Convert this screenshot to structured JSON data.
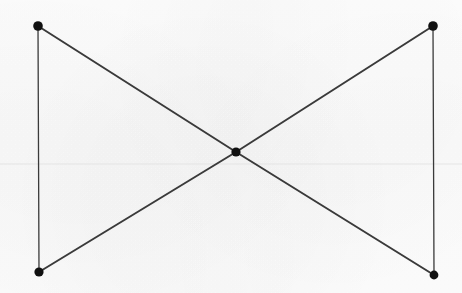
{
  "diagram": {
    "kind": "node-link-graph",
    "canvas": {
      "width": 462,
      "height": 293
    },
    "background_color": "#fcfcfc",
    "node_color": "#101010",
    "edge_color": "#3a3a3a",
    "edge_width": 1.9,
    "node_radius": 4.6,
    "nodes": [
      {
        "id": "top-left",
        "label": "",
        "x": 38,
        "y": 26,
        "radius": 4.8
      },
      {
        "id": "top-right",
        "label": "",
        "x": 433,
        "y": 26,
        "radius": 4.8
      },
      {
        "id": "center",
        "label": "",
        "x": 236,
        "y": 152,
        "radius": 4.6
      },
      {
        "id": "bottom-left",
        "label": "",
        "x": 39,
        "y": 272,
        "radius": 4.6
      },
      {
        "id": "bottom-right",
        "label": "",
        "x": 434,
        "y": 275,
        "radius": 4.4
      }
    ],
    "edges": [
      {
        "id": "edge-tl-center",
        "from": "top-left",
        "to": "center",
        "width": 2.0
      },
      {
        "id": "edge-center-br",
        "from": "center",
        "to": "bottom-right",
        "width": 2.0
      },
      {
        "id": "edge-tr-center",
        "from": "top-right",
        "to": "center",
        "width": 2.0
      },
      {
        "id": "edge-center-bl",
        "from": "center",
        "to": "bottom-left",
        "width": 2.0
      },
      {
        "id": "edge-tl-bl",
        "from": "top-left",
        "to": "bottom-left",
        "width": 1.3
      },
      {
        "id": "edge-tr-br",
        "from": "top-right",
        "to": "bottom-right",
        "width": 1.3
      }
    ],
    "guide_lines": [
      {
        "id": "scan-rule",
        "orientation": "horizontal",
        "y": 164,
        "x1": 0,
        "x2": 462,
        "color": "#e2e2e2",
        "width": 0.9
      }
    ]
  }
}
